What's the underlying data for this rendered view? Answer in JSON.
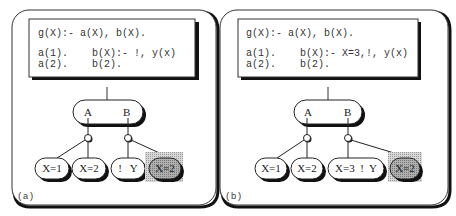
{
  "panels": [
    {
      "id": "a",
      "caption": "(a)",
      "code": {
        "line1": "g(X):- a(X), b(X).",
        "line2_left": "a(1).",
        "line2_right": "b(X):- !, y(x)",
        "line3_left": "a(2).",
        "line3_right": "b(2)."
      },
      "goal_node": {
        "left": "A",
        "right": "B"
      },
      "leaves": [
        {
          "label": "X=1",
          "shaded": false
        },
        {
          "label": "X=2",
          "shaded": false
        },
        {
          "label": "!   Y",
          "shaded": false
        },
        {
          "label": "X=2",
          "shaded": true
        }
      ]
    },
    {
      "id": "b",
      "caption": "(b)",
      "code": {
        "line1": "g(X):- a(X), b(X).",
        "line2_left": "a(1).",
        "line2_right": "b(X):- X=3,!, y(x)",
        "line3_left": "a(2).",
        "line3_right": "b(2)."
      },
      "goal_node": {
        "left": "A",
        "right": "B"
      },
      "leaves": [
        {
          "label": "X=1",
          "shaded": false
        },
        {
          "label": "X=2",
          "shaded": false
        },
        {
          "label": "X=3  !  Y",
          "shaded": false
        },
        {
          "label": "X=2",
          "shaded": true
        }
      ]
    }
  ],
  "colors": {
    "stroke": "#111111",
    "shade": "#9a9a9a",
    "dotted": "#bdbdbd",
    "text": "#222222"
  }
}
